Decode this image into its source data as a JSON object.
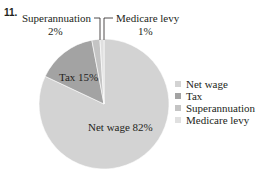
{
  "question_number": "11.",
  "chart_data": {
    "type": "pie",
    "title": "",
    "categories": [
      "Net wage",
      "Tax",
      "Superannuation",
      "Medicare levy"
    ],
    "values": [
      82,
      15,
      2,
      1
    ],
    "units": "%",
    "colors": [
      "#d3d3d3",
      "#a3a3a3",
      "#c4c4c4",
      "#e0e0e0"
    ],
    "slice_labels": {
      "net_wage": "Net wage 82%",
      "tax": "Tax 15%",
      "superannuation_name": "Superannuation",
      "superannuation_pct": "2%",
      "medicare_name": "Medicare levy",
      "medicare_pct": "1%"
    },
    "legend": {
      "position": "right",
      "entries": [
        "Net wage",
        "Tax",
        "Superannuation",
        "Medicare levy"
      ]
    }
  }
}
